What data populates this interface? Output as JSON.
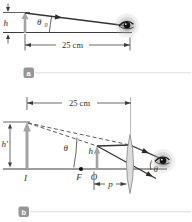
{
  "figure_type": "optics ray diagram, two panels",
  "colors": {
    "line": "#3c3c3c",
    "gray_arrow": "#a3a3a3",
    "lens_fill": "#dcdcdc",
    "lens_stroke": "#8f8f8f",
    "badge_background": "#969696",
    "badge_text": "#ffffff",
    "divider": "#dddddd",
    "background": "#ffffff"
  },
  "panel_a": {
    "badge_label": "a",
    "h_label": "h",
    "theta_label": "θ",
    "theta_subscript": "0",
    "distance_label": "25 cm"
  },
  "panel_b": {
    "badge_label": "b",
    "distance_label": "25 cm",
    "h_prime_label": "h′",
    "image_label": "I",
    "theta_label": "θ",
    "focal_point_label": "F",
    "origin_label": "O",
    "object_height_label": "h",
    "object_distance_label": "p",
    "eye_angle_label": "θ"
  }
}
